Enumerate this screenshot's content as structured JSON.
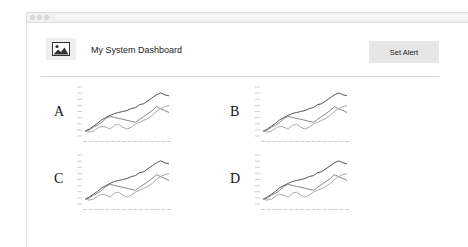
{
  "window": {
    "controls": [
      "close",
      "minimize",
      "maximize"
    ]
  },
  "header": {
    "logo_icon": "image-icon",
    "title": "My System Dashboard",
    "set_alert_label": "Set Alert"
  },
  "panels": [
    {
      "label": "A"
    },
    {
      "label": "B"
    },
    {
      "label": "C"
    },
    {
      "label": "D"
    }
  ],
  "chart_data": [
    {
      "type": "line",
      "panel": "A",
      "title": "",
      "xlabel": "",
      "ylabel": "",
      "grid": false,
      "legend": "none",
      "x": [
        0,
        1,
        2,
        3,
        4,
        5,
        6,
        7,
        8,
        9,
        10,
        11,
        12,
        13,
        14,
        15,
        16,
        17,
        18,
        19,
        20
      ],
      "series": [
        {
          "name": "series-1",
          "color": "#555555",
          "values": [
            10,
            14,
            20,
            26,
            33,
            38,
            42,
            46,
            48,
            50,
            52,
            56,
            58,
            64,
            66,
            72,
            78,
            84,
            88,
            84,
            82
          ]
        },
        {
          "name": "series-2",
          "color": "#888888",
          "values": [
            10,
            12,
            18,
            22,
            28,
            36,
            40,
            38,
            36,
            34,
            32,
            30,
            28,
            34,
            40,
            46,
            52,
            60,
            56,
            52,
            48
          ]
        },
        {
          "name": "series-3",
          "color": "#aaaaaa",
          "values": [
            10,
            8,
            10,
            16,
            20,
            18,
            14,
            22,
            24,
            18,
            14,
            18,
            24,
            28,
            32,
            36,
            42,
            50,
            56,
            60,
            62
          ]
        }
      ],
      "ylim": [
        0,
        100
      ]
    },
    {
      "type": "line",
      "panel": "B",
      "x": [
        0,
        1,
        2,
        3,
        4,
        5,
        6,
        7,
        8,
        9,
        10,
        11,
        12,
        13,
        14,
        15,
        16,
        17,
        18,
        19,
        20
      ],
      "series": [
        {
          "name": "series-1",
          "color": "#555555",
          "values": [
            10,
            14,
            20,
            26,
            33,
            38,
            42,
            46,
            48,
            50,
            52,
            56,
            58,
            64,
            66,
            72,
            78,
            84,
            88,
            84,
            82
          ]
        },
        {
          "name": "series-2",
          "color": "#888888",
          "values": [
            10,
            12,
            18,
            22,
            28,
            36,
            40,
            38,
            36,
            34,
            32,
            30,
            28,
            34,
            40,
            46,
            52,
            60,
            56,
            52,
            48
          ]
        },
        {
          "name": "series-3",
          "color": "#aaaaaa",
          "values": [
            10,
            8,
            10,
            16,
            20,
            18,
            14,
            22,
            24,
            18,
            14,
            18,
            24,
            28,
            32,
            36,
            42,
            50,
            56,
            60,
            62
          ]
        }
      ],
      "ylim": [
        0,
        100
      ]
    },
    {
      "type": "line",
      "panel": "C",
      "x": [
        0,
        1,
        2,
        3,
        4,
        5,
        6,
        7,
        8,
        9,
        10,
        11,
        12,
        13,
        14,
        15,
        16,
        17,
        18,
        19,
        20
      ],
      "series": [
        {
          "name": "series-1",
          "color": "#555555",
          "values": [
            10,
            14,
            20,
            26,
            33,
            38,
            42,
            46,
            48,
            50,
            52,
            56,
            58,
            64,
            66,
            72,
            78,
            84,
            88,
            84,
            82
          ]
        },
        {
          "name": "series-2",
          "color": "#888888",
          "values": [
            10,
            12,
            18,
            22,
            28,
            36,
            40,
            38,
            36,
            34,
            32,
            30,
            28,
            34,
            40,
            46,
            52,
            60,
            56,
            52,
            48
          ]
        },
        {
          "name": "series-3",
          "color": "#aaaaaa",
          "values": [
            10,
            8,
            10,
            16,
            20,
            18,
            14,
            22,
            24,
            18,
            14,
            18,
            24,
            28,
            32,
            36,
            42,
            50,
            56,
            60,
            62
          ]
        }
      ],
      "ylim": [
        0,
        100
      ]
    },
    {
      "type": "line",
      "panel": "D",
      "x": [
        0,
        1,
        2,
        3,
        4,
        5,
        6,
        7,
        8,
        9,
        10,
        11,
        12,
        13,
        14,
        15,
        16,
        17,
        18,
        19,
        20
      ],
      "series": [
        {
          "name": "series-1",
          "color": "#555555",
          "values": [
            10,
            14,
            20,
            26,
            33,
            38,
            42,
            46,
            48,
            50,
            52,
            56,
            58,
            64,
            66,
            72,
            78,
            84,
            88,
            84,
            82
          ]
        },
        {
          "name": "series-2",
          "color": "#888888",
          "values": [
            10,
            12,
            18,
            22,
            28,
            36,
            40,
            38,
            36,
            34,
            32,
            30,
            28,
            34,
            40,
            46,
            52,
            60,
            56,
            52,
            48
          ]
        },
        {
          "name": "series-3",
          "color": "#aaaaaa",
          "values": [
            10,
            8,
            10,
            16,
            20,
            18,
            14,
            22,
            24,
            18,
            14,
            18,
            24,
            28,
            32,
            36,
            42,
            50,
            56,
            60,
            62
          ]
        }
      ],
      "ylim": [
        0,
        100
      ]
    }
  ]
}
